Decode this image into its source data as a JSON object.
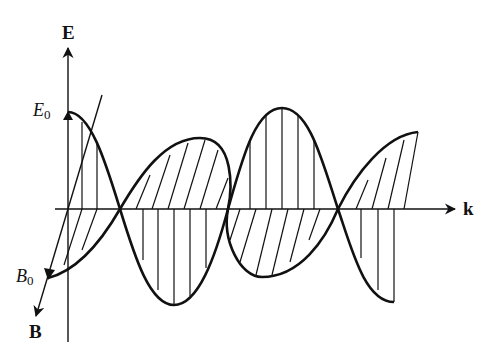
{
  "diagram": {
    "type": "electromagnetic-wave",
    "axes": {
      "e_axis_label": "E",
      "k_axis_label": "k",
      "b_axis_label": "B"
    },
    "amplitude_labels": {
      "e_amplitude": "E",
      "e_amplitude_sub": "0",
      "b_amplitude": "B",
      "b_amplitude_sub": "0"
    },
    "colors": {
      "line": "#111111",
      "background": "#ffffff"
    }
  }
}
